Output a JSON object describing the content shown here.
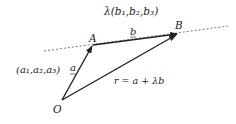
{
  "diagram": {
    "type": "vector-line-equation",
    "points": {
      "O": {
        "label": "O",
        "x": 62,
        "y": 100
      },
      "A": {
        "label": "A",
        "x": 93,
        "y": 45
      },
      "B": {
        "label": "B",
        "x": 178,
        "y": 33
      }
    },
    "labels": {
      "direction": "λ(b₁,b₂,b₃)",
      "b_vector": "b",
      "a_vector": "a",
      "a_coords": "(a₁,a₂,a₃)",
      "equation": "r = a + λb",
      "point_A": "A",
      "point_B": "B",
      "point_O": "O"
    },
    "colors": {
      "line": "#222222",
      "dashed": "#555555",
      "background": "#ffffff"
    }
  }
}
